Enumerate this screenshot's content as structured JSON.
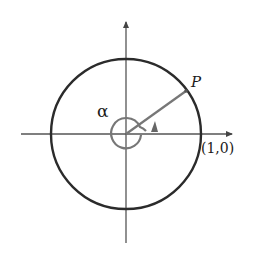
{
  "diagram": {
    "labels": {
      "angle": "α",
      "point": "P",
      "intercept": "(1,0)"
    },
    "geometry": {
      "center": [
        126,
        134
      ],
      "unit_circle_radius": 75,
      "angle_arc_radius": 15,
      "terminal_point": [
        187,
        91
      ]
    },
    "colors": {
      "background": "#ffffff",
      "axes": "#555555",
      "unit_circle": "#2b2b2b",
      "terminal_side": "#777777",
      "angle_arc": "#777777",
      "text": "#1a1a1a"
    }
  }
}
